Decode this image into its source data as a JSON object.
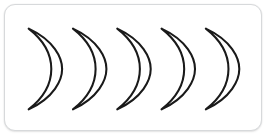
{
  "canvas": {
    "width": 269,
    "height": 136,
    "background_color": "#ffffff"
  },
  "card": {
    "label": "rounded-white-card",
    "background_color": "#ffffff",
    "border_color": "#d7d9db",
    "border_radius_px": 11,
    "x": 4,
    "y": 4,
    "width": 258,
    "height": 127
  },
  "figure": {
    "shape_name": "crescent-moon",
    "count": 5,
    "orientation": "concave-left",
    "stroke_color": "#1a1a1a",
    "fill_color": "#ffffff",
    "stroke_width": 2.1,
    "spacing_px": 45,
    "shapes": [
      {
        "id": "crescent-1",
        "index": 1,
        "center_x": 44,
        "center_y": 68,
        "tip_top_x": 27,
        "tip_top_y": 28,
        "tip_bottom_x": 27,
        "tip_bottom_y": 109,
        "outer_x": 63
      },
      {
        "id": "crescent-2",
        "index": 2,
        "center_x": 89,
        "center_y": 68,
        "tip_top_x": 72,
        "tip_top_y": 28,
        "tip_bottom_x": 72,
        "tip_bottom_y": 109,
        "outer_x": 108
      },
      {
        "id": "crescent-3",
        "index": 3,
        "center_x": 134,
        "center_y": 68,
        "tip_top_x": 117,
        "tip_top_y": 28,
        "tip_bottom_x": 117,
        "tip_bottom_y": 109,
        "outer_x": 153
      },
      {
        "id": "crescent-4",
        "index": 4,
        "center_x": 179,
        "center_y": 68,
        "tip_top_x": 162,
        "tip_top_y": 28,
        "tip_bottom_x": 162,
        "tip_bottom_y": 109,
        "outer_x": 198
      },
      {
        "id": "crescent-5",
        "index": 5,
        "center_x": 224,
        "center_y": 68,
        "tip_top_x": 207,
        "tip_top_y": 28,
        "tip_bottom_x": 207,
        "tip_bottom_y": 109,
        "outer_x": 243
      }
    ],
    "geometry": {
      "outer_arc": "M 0 0 C 26 12 34 30 34 41 C 34 52 26 70 0 82",
      "inner_arc": "C 18 68 23 53 23 41 C 23 29 18 14 0 0",
      "path_d": "M 0 0 C 26 12 34 30 34 41 C 34 52 26 70 0 82 C 18 68 23 53 23 41 C 23 29 18 14 0 0 Z",
      "width": 34,
      "height": 82
    }
  }
}
